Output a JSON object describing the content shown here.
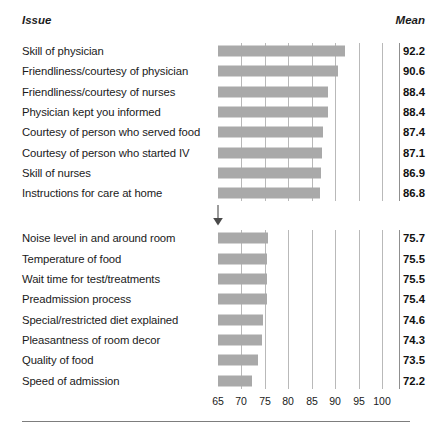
{
  "header": {
    "issue_label": "Issue",
    "mean_label": "Mean"
  },
  "chart_data": {
    "type": "bar",
    "orientation": "horizontal",
    "title": "",
    "subtitle": "",
    "xlabel": "",
    "ylabel": "",
    "xlim": [
      65,
      100
    ],
    "xticks": [
      65,
      70,
      75,
      80,
      85,
      90,
      95,
      100
    ],
    "xticklabels": [
      "65",
      "70",
      "75",
      "80",
      "85",
      "90",
      "95",
      "100"
    ],
    "grid": true,
    "grid_axis": "x",
    "legend": false,
    "bar_color": "#a9a9a9",
    "value_column_header": "Mean",
    "categories": [
      "Skill of physician",
      "Friendliness/courtesy of physician",
      "Friendliness/courtesy of nurses",
      "Physician kept you informed",
      "Courtesy of person who served food",
      "Courtesy of person who started IV",
      "Skill of nurses",
      "Instructions for care at home",
      "Noise level in and around room",
      "Temperature of food",
      "Wait time for test/treatments",
      "Preadmission process",
      "Special/restricted diet explained",
      "Pleasantness of room decor",
      "Quality of food",
      "Speed of admission"
    ],
    "values": [
      92.2,
      90.6,
      88.4,
      88.4,
      87.4,
      87.1,
      86.9,
      86.8,
      75.7,
      75.5,
      75.5,
      75.4,
      74.6,
      74.3,
      73.5,
      72.2
    ],
    "value_labels": [
      "92.2",
      "90.6",
      "88.4",
      "88.4",
      "87.4",
      "87.1",
      "86.9",
      "86.8",
      "75.7",
      "75.5",
      "75.5",
      "75.4",
      "74.6",
      "74.3",
      "73.5",
      "72.2"
    ],
    "groups": [
      {
        "name": "top-group",
        "start_index": 0,
        "end_index": 7
      },
      {
        "name": "bottom-group",
        "start_index": 8,
        "end_index": 15
      }
    ],
    "annotations": [
      {
        "name": "group-break-arrow",
        "type": "down-arrow",
        "between_indices": [
          7,
          8
        ]
      }
    ]
  }
}
